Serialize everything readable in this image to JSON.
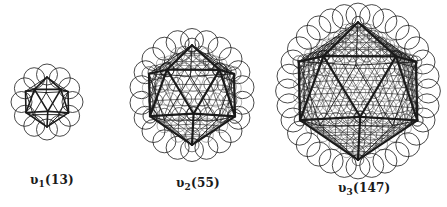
{
  "figure": {
    "clusters": [
      {
        "id": "v1",
        "symbol": "υ",
        "index": "1",
        "count": "(13)",
        "cx": 47,
        "cy": 102,
        "R": 25,
        "freq": 1,
        "circle_r": 10.5,
        "label_x": 30,
        "label_y": 173
      },
      {
        "id": "v2",
        "symbol": "υ",
        "index": "2",
        "count": "(55)",
        "cx": 192,
        "cy": 95,
        "R": 50,
        "freq": 3,
        "circle_r": 11.5,
        "label_x": 176,
        "label_y": 176
      },
      {
        "id": "v3",
        "symbol": "υ",
        "index": "3",
        "count": "(147)",
        "cx": 358,
        "cy": 91,
        "R": 69,
        "freq": 5,
        "circle_r": 12,
        "label_x": 338,
        "label_y": 181
      }
    ]
  },
  "colors": {
    "stroke": "#1a1a1a",
    "background": "#ffffff"
  }
}
